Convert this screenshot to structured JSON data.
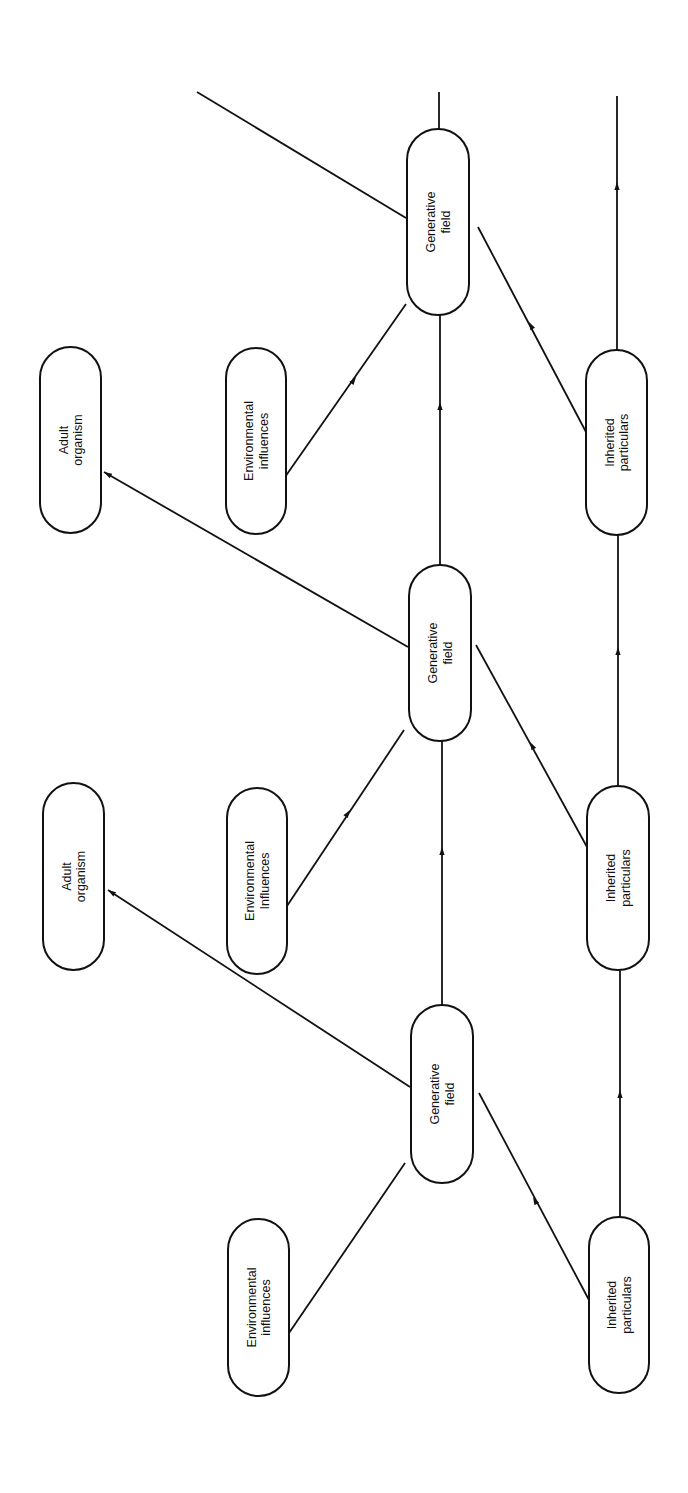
{
  "diagram": {
    "title": "",
    "orientation": "rotated -90deg (text reads bottom-to-top)",
    "colors": {
      "stroke": "#111111",
      "background": "#ffffff",
      "text": "#111111"
    },
    "nodes": [
      {
        "id": "gf1",
        "type": "generative-field",
        "lines": [
          "Generative",
          "field"
        ],
        "x": 407,
        "y": 129,
        "w": 62,
        "h": 186
      },
      {
        "id": "gf2",
        "type": "generative-field",
        "lines": [
          "Generative",
          "field"
        ],
        "x": 409,
        "y": 565,
        "w": 62,
        "h": 176
      },
      {
        "id": "gf3",
        "type": "generative-field",
        "lines": [
          "Generative",
          "field"
        ],
        "x": 411,
        "y": 1005,
        "w": 62,
        "h": 178
      },
      {
        "id": "adult1",
        "type": "adult-organism",
        "lines": [
          "Adult",
          "organism"
        ],
        "x": 40,
        "y": 347,
        "w": 61,
        "h": 186
      },
      {
        "id": "adult2",
        "type": "adult-organism",
        "lines": [
          "Adult",
          "organism"
        ],
        "x": 43,
        "y": 783,
        "w": 61,
        "h": 187
      },
      {
        "id": "env1",
        "type": "environmental-influences",
        "lines": [
          "Environmental",
          "influences"
        ],
        "x": 226,
        "y": 348,
        "w": 60,
        "h": 186
      },
      {
        "id": "env2",
        "type": "environmental-influences",
        "lines": [
          "Environmental",
          "Influences"
        ],
        "x": 227,
        "y": 788,
        "w": 60,
        "h": 186
      },
      {
        "id": "env3",
        "type": "environmental-influences",
        "lines": [
          "Environmental",
          "influences"
        ],
        "x": 228,
        "y": 1219,
        "w": 61,
        "h": 177
      },
      {
        "id": "inh1",
        "type": "inherited-particulars",
        "lines": [
          "Inherited",
          "particulars"
        ],
        "x": 586,
        "y": 350,
        "w": 61,
        "h": 185
      },
      {
        "id": "inh2",
        "type": "inherited-particulars",
        "lines": [
          "Inherited",
          "particulars"
        ],
        "x": 587,
        "y": 786,
        "w": 62,
        "h": 184
      },
      {
        "id": "inh3",
        "type": "inherited-particulars",
        "lines": [
          "Inherited",
          "particulars"
        ],
        "x": 589,
        "y": 1217,
        "w": 60,
        "h": 176
      }
    ],
    "edges": [
      {
        "from": "top-offpage",
        "to": "gf1",
        "x1": 197,
        "y1": 92,
        "x2": 406,
        "y2": 218,
        "arrow": false
      },
      {
        "from": "gf1",
        "to": "top-offpage",
        "x1": 439,
        "y1": 129,
        "x2": 439,
        "y2": 92,
        "arrow": false
      },
      {
        "from": "inh1",
        "to": "top-offpage",
        "x1": 617,
        "y1": 350,
        "x2": 617,
        "y2": 96,
        "arrow": true,
        "ax": 617,
        "ay": 182
      },
      {
        "from": "env1",
        "to": "gf1",
        "x1": 285,
        "y1": 477,
        "x2": 406,
        "y2": 304,
        "arrow": true,
        "ax": 356,
        "ay": 377
      },
      {
        "from": "inh1",
        "to": "gf1",
        "x1": 586,
        "y1": 432,
        "x2": 478,
        "y2": 227,
        "arrow": true,
        "ax": 529,
        "ay": 322
      },
      {
        "from": "gf2",
        "to": "gf1",
        "x1": 440,
        "y1": 565,
        "x2": 440,
        "y2": 315,
        "arrow": true,
        "ax": 440,
        "ay": 402
      },
      {
        "from": "gf2",
        "to": "adult1",
        "x1": 408,
        "y1": 647,
        "x2": 104,
        "y2": 472,
        "arrow": true,
        "ax": 104,
        "ay": 472,
        "tip": true
      },
      {
        "from": "inh2",
        "to": "inh1",
        "x1": 618,
        "y1": 786,
        "x2": 618,
        "y2": 535,
        "arrow": true,
        "ax": 618,
        "ay": 647
      },
      {
        "from": "env2",
        "to": "gf2",
        "x1": 287,
        "y1": 906,
        "x2": 404,
        "y2": 730,
        "arrow": true,
        "ax": 350,
        "ay": 810
      },
      {
        "from": "inh2",
        "to": "gf2",
        "x1": 587,
        "y1": 847,
        "x2": 476,
        "y2": 645,
        "arrow": true,
        "ax": 530,
        "ay": 742
      },
      {
        "from": "gf3",
        "to": "gf2",
        "x1": 442,
        "y1": 1005,
        "x2": 442,
        "y2": 741,
        "arrow": true,
        "ax": 442,
        "ay": 847
      },
      {
        "from": "gf3",
        "to": "adult2",
        "x1": 410,
        "y1": 1087,
        "x2": 108,
        "y2": 890,
        "arrow": true,
        "ax": 108,
        "ay": 890,
        "tip": true
      },
      {
        "from": "inh3",
        "to": "inh2",
        "x1": 620,
        "y1": 1217,
        "x2": 620,
        "y2": 970,
        "arrow": true,
        "ax": 620,
        "ay": 1090
      },
      {
        "from": "env3",
        "to": "gf3",
        "x1": 289,
        "y1": 1333,
        "x2": 405,
        "y2": 1163,
        "arrow": false
      },
      {
        "from": "inh3",
        "to": "gf3",
        "x1": 589,
        "y1": 1300,
        "x2": 479,
        "y2": 1093,
        "arrow": true,
        "ax": 533,
        "ay": 1197
      }
    ]
  }
}
